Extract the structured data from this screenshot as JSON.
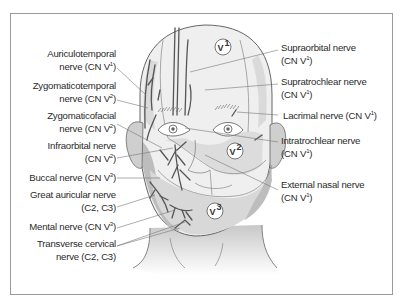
{
  "figure": {
    "zones": [
      {
        "id": "V1",
        "label": "V",
        "sup": "1"
      },
      {
        "id": "V2",
        "label": "V",
        "sup": "2"
      },
      {
        "id": "V3",
        "label": "V",
        "sup": "3"
      }
    ],
    "left_labels": [
      {
        "line1": "Auriculotemporal",
        "line2_pre": "nerve (CN V",
        "sup": "1",
        "line2_post": ")"
      },
      {
        "line1": "Zygomaticotemporal",
        "line2_pre": "nerve (CN V",
        "sup": "2",
        "line2_post": ")"
      },
      {
        "line1": "Zygomaticofacial",
        "line2_pre": "nerve (CN V",
        "sup": "2",
        "line2_post": ")"
      },
      {
        "line1": "Infraorbital nerve",
        "line2_pre": "(CN V",
        "sup": "2",
        "line2_post": ")"
      },
      {
        "line1_pre": "Buccal nerve (CN V",
        "sup": "3",
        "line1_post": ")"
      },
      {
        "line1": "Great auricular nerve",
        "line2": "(C2, C3)"
      },
      {
        "line1_pre": "Mental nerve (CN V",
        "sup": "3",
        "line1_post": ")"
      },
      {
        "line1": "Transverse cervical",
        "line2": "nerve (C2, C3)"
      }
    ],
    "right_labels": [
      {
        "line1": "Supraorbital nerve",
        "line2_pre": "(CN V",
        "sup": "1",
        "line2_post": ")"
      },
      {
        "line1": "Supratrochlear nerve",
        "line2_pre": "(CN V",
        "sup": "1",
        "line2_post": ")"
      },
      {
        "line1_pre": "Lacrimal nerve (CN V",
        "sup": "1",
        "line1_post": ")"
      },
      {
        "line1": "Intratrochlear nerve",
        "line2_pre": "(CN V",
        "sup": "1",
        "line2_post": ")"
      },
      {
        "line1": "External nasal nerve",
        "line2_pre": "(CN V",
        "sup": "1",
        "line2_post": ")"
      }
    ]
  },
  "colors": {
    "frame": "#9a9a9a",
    "skin": "#efefef",
    "shade_dark": "#bdbdbd",
    "shade_mid": "#d6d6d6",
    "nerve": "#555555",
    "leader": "#777777",
    "text": "#2a2a2a"
  }
}
